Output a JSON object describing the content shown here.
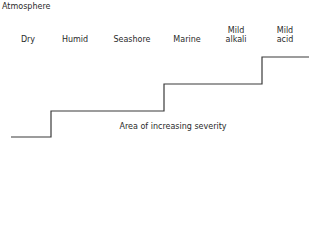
{
  "title": "Atmosphere",
  "categories": [
    {
      "label": "Dry",
      "line1": "",
      "line2": "Dry"
    },
    {
      "label": "Humid",
      "line1": "",
      "line2": "Humid"
    },
    {
      "label": "Seashore",
      "line1": "",
      "line2": "Seashore"
    },
    {
      "label": "Marine",
      "line1": "",
      "line2": "Marine"
    },
    {
      "label": "Mild alkali",
      "line1": "Mild",
      "line2": "alkali"
    },
    {
      "label": "Mild acid",
      "line1": "Mild",
      "line2": "acid"
    }
  ],
  "annotation": "Area of increasing severity",
  "staircase": {
    "steps": [
      {
        "x_start": 11,
        "x_end": 51,
        "y": 137
      },
      {
        "x_start": 51,
        "x_end": 164,
        "y": 111
      },
      {
        "x_start": 164,
        "x_end": 262,
        "y": 84
      },
      {
        "x_start": 262,
        "x_end": 309,
        "y": 57
      }
    ],
    "line_color": "#3a3a3a"
  }
}
